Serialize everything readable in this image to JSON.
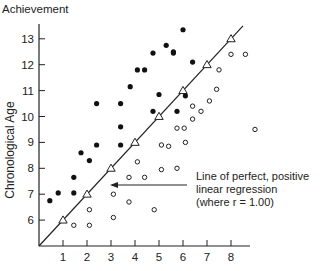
{
  "chart_data": {
    "type": "scatter",
    "title": "",
    "xlabel": "Achievement",
    "ylabel": "Chronological Age",
    "x_ticks": [
      1,
      2,
      3,
      4,
      5,
      6,
      7,
      8
    ],
    "y_ticks": [
      6,
      7,
      8,
      9,
      10,
      11,
      12,
      13
    ],
    "xlim": [
      0,
      9
    ],
    "ylim": [
      5,
      13.8
    ],
    "grid": false,
    "annotation": {
      "lines": [
        "Line of perfect, positive",
        "linear regression",
        "(where r = 1.00)"
      ],
      "r_value": "1.00"
    },
    "series": [
      {
        "name": "Perfect regression (triangles)",
        "marker": "triangle-open",
        "points": [
          [
            1,
            6
          ],
          [
            2,
            7
          ],
          [
            3,
            8
          ],
          [
            4,
            9
          ],
          [
            5,
            10
          ],
          [
            6,
            11
          ],
          [
            7,
            12
          ],
          [
            8,
            13
          ]
        ]
      },
      {
        "name": "Above line (filled)",
        "marker": "circle-filled",
        "points": [
          [
            0.45,
            6.75
          ],
          [
            0.8,
            7.05
          ],
          [
            1.45,
            7.05
          ],
          [
            1.45,
            7.65
          ],
          [
            1.75,
            8.6
          ],
          [
            2.1,
            8.3
          ],
          [
            2.4,
            8.9
          ],
          [
            3.4,
            8.9
          ],
          [
            3.4,
            9.6
          ],
          [
            2.4,
            10.5
          ],
          [
            3.4,
            10.5
          ],
          [
            3.8,
            11.15
          ],
          [
            4.1,
            11.8
          ],
          [
            4.4,
            11.8
          ],
          [
            4.75,
            12.45
          ],
          [
            5.3,
            12.75
          ],
          [
            5.6,
            12.45
          ],
          [
            6.0,
            13.35
          ],
          [
            4.75,
            10.2
          ],
          [
            5.0,
            10.85
          ],
          [
            5.75,
            10.2
          ],
          [
            6.4,
            12.1
          ],
          [
            6.1,
            10.8
          ],
          [
            5.6,
            12.5
          ]
        ]
      },
      {
        "name": "Below line (open)",
        "marker": "circle-open",
        "points": [
          [
            1.45,
            5.8
          ],
          [
            2.1,
            5.8
          ],
          [
            2.1,
            6.4
          ],
          [
            3.1,
            6.1
          ],
          [
            3.1,
            7.0
          ],
          [
            3.75,
            6.7
          ],
          [
            4.1,
            8.25
          ],
          [
            3.75,
            7.65
          ],
          [
            4.4,
            7.65
          ],
          [
            4.8,
            6.4
          ],
          [
            5.1,
            8.9
          ],
          [
            5.1,
            7.95
          ],
          [
            5.4,
            8.85
          ],
          [
            5.75,
            8.0
          ],
          [
            5.75,
            9.55
          ],
          [
            6.05,
            9.55
          ],
          [
            6.1,
            9.0
          ],
          [
            6.4,
            9.9
          ],
          [
            6.4,
            10.4
          ],
          [
            6.75,
            10.2
          ],
          [
            7.1,
            10.6
          ],
          [
            7.4,
            11.05
          ],
          [
            7.5,
            11.8
          ],
          [
            8.0,
            12.4
          ],
          [
            8.6,
            12.4
          ],
          [
            9.0,
            9.5
          ]
        ]
      }
    ]
  }
}
